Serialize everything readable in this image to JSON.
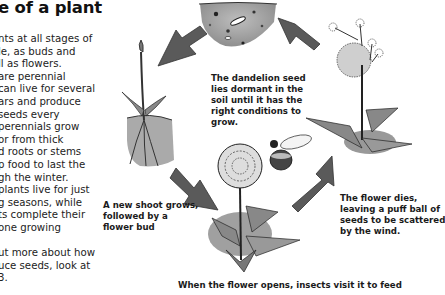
{
  "page": {
    "title": "e of a plant",
    "body_lines": [
      "nts at all stages of",
      "le, as buds and",
      "ll as flowers.",
      "are perennial",
      "can live for several",
      "ars and produce",
      "seeds every",
      "perennials grow",
      "or from thick",
      "d roots or stems",
      "p food to last the",
      "gh the winter.",
      "plants live for just",
      "g seasons, while",
      "ts complete their",
      "one growing",
      "",
      "ut more about how",
      "uce seeds, look at",
      "3."
    ]
  },
  "diagram": {
    "captions": {
      "seed": [
        "The dandelion seed",
        "lies dormant in the",
        "soil until it has the",
        "right conditions to",
        "grow."
      ],
      "shoot": [
        "A new shoot grows,",
        "followed by a",
        "flower bud"
      ],
      "flower": [
        "When the flower opens, insects visit it to feed"
      ],
      "dies": [
        "The flower dies,",
        "leaving a puff ball of",
        "seeds to be scattered",
        "by the wind."
      ]
    },
    "illustrations": [
      "soil-with-seed",
      "shoot-with-bud",
      "flowering-dandelion-with-bee",
      "seed-head-puffball"
    ],
    "arrow_color": "#555555"
  }
}
